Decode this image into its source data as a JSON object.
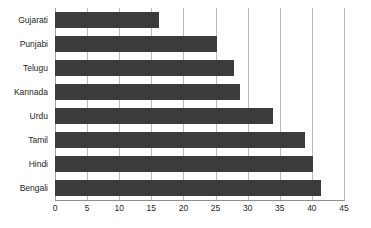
{
  "chart_data": {
    "type": "bar",
    "orientation": "horizontal",
    "title": "",
    "subtitle": "",
    "xlabel": "",
    "ylabel": "",
    "xlim": [
      0,
      45
    ],
    "xticks": [
      0,
      5,
      10,
      15,
      20,
      25,
      30,
      35,
      40,
      45
    ],
    "grid": true,
    "legend": false,
    "categories": [
      "Gujarati",
      "Punjabi",
      "Telugu",
      "Kannada",
      "Urdu",
      "Tamil",
      "Hindi",
      "Bengali"
    ],
    "values": [
      16.2,
      25.2,
      27.8,
      28.8,
      33.9,
      38.9,
      40.2,
      41.4
    ],
    "series": [
      {
        "name": "",
        "values": [
          16.2,
          25.2,
          27.8,
          28.8,
          33.9,
          38.9,
          40.2,
          41.4
        ]
      }
    ],
    "colors": {
      "bar": "#3b3b3b",
      "gridline": "#b9b9b9",
      "axis": "#8f8f8f",
      "text": "#231f20",
      "background": "#ffffff"
    }
  }
}
